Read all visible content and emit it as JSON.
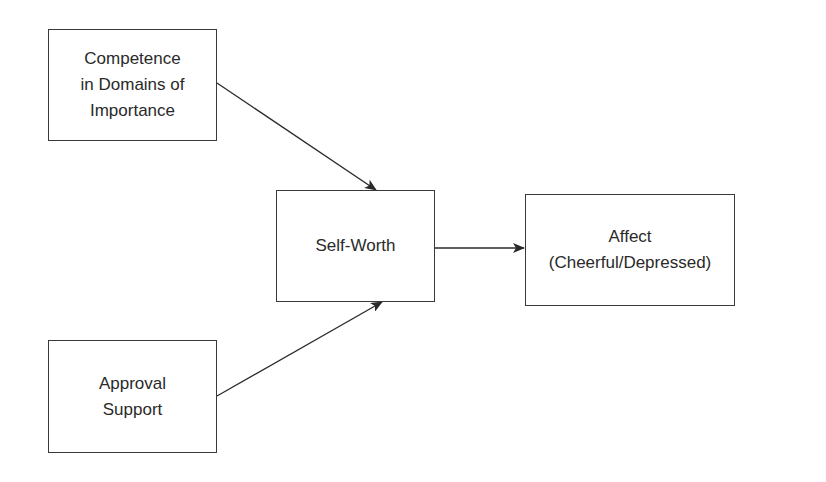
{
  "diagram": {
    "nodes": [
      {
        "id": "competence",
        "label": "Competence\nin Domains of\nImportance"
      },
      {
        "id": "self_worth",
        "label": "Self-Worth"
      },
      {
        "id": "affect",
        "label": "Affect\n(Cheerful/Depressed)"
      },
      {
        "id": "approval",
        "label": "Approval\nSupport"
      }
    ],
    "edges": [
      {
        "from": "competence",
        "to": "self_worth"
      },
      {
        "from": "approval",
        "to": "self_worth"
      },
      {
        "from": "self_worth",
        "to": "affect"
      }
    ],
    "colors": {
      "line": "#2a2a2a",
      "background": "#ffffff"
    }
  }
}
